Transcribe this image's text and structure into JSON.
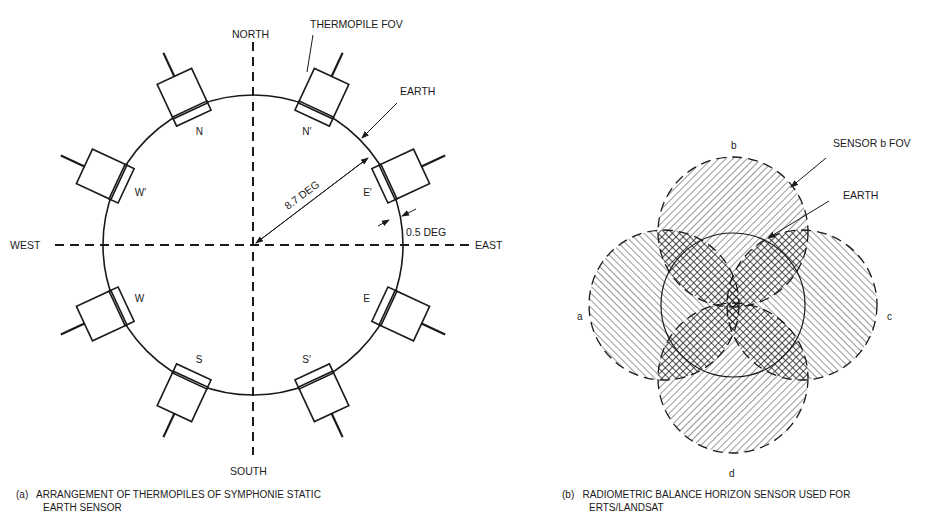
{
  "figure_a": {
    "directions": {
      "north": "NORTH",
      "south": "SOUTH",
      "east": "EAST",
      "west": "WEST"
    },
    "callouts": {
      "thermopile_fov": "THERMOPILE FOV",
      "earth": "EARTH",
      "radius": "8.7 DEG",
      "gap": "0.5 DEG"
    },
    "sensors": [
      {
        "id": "N",
        "label": "N",
        "angle_deg": 115
      },
      {
        "id": "N'",
        "label": "N′",
        "angle_deg": 65
      },
      {
        "id": "E'",
        "label": "E′",
        "angle_deg": 25
      },
      {
        "id": "E",
        "label": "E",
        "angle_deg": -25
      },
      {
        "id": "S'",
        "label": "S′",
        "angle_deg": -65
      },
      {
        "id": "S",
        "label": "S",
        "angle_deg": -115
      },
      {
        "id": "W",
        "label": "W",
        "angle_deg": -155
      },
      {
        "id": "W'",
        "label": "W′",
        "angle_deg": 155
      }
    ],
    "caption_line1": "(a)   ARRANGEMENT OF THERMOPILES OF SYMPHONIE STATIC",
    "caption_line2": "EARTH SENSOR"
  },
  "figure_b": {
    "sensor_labels": {
      "a": "a",
      "b": "b",
      "c": "c",
      "d": "d"
    },
    "callouts": {
      "sensor_fov": "SENSOR b FOV",
      "earth": "EARTH"
    },
    "caption_line1": "(b)   RADIOMETRIC BALANCE HORIZON SENSOR USED FOR",
    "caption_line2": "ERTS/LANDSAT"
  },
  "colors": {
    "ink": "#1a1a1a",
    "background": "#ffffff"
  }
}
